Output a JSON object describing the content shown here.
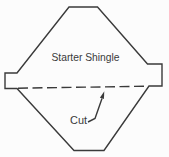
{
  "diagram": {
    "labels": {
      "shingle": "Starter Shingle",
      "cut": "Cut"
    },
    "colors": {
      "line": "#3a3a3a",
      "text": "#3a3a3a",
      "background": "#fcfcfc"
    }
  }
}
